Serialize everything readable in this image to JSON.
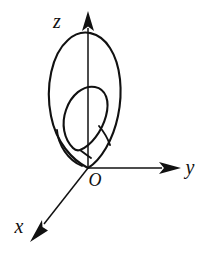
{
  "figure": {
    "background_color": "#ffffff",
    "stroke_color": "#111111",
    "width": 212,
    "height": 253
  },
  "axes": {
    "origin_label": "O",
    "items": [
      {
        "name": "z",
        "label": "z",
        "direction": "up",
        "label_position": {
          "x": 57,
          "y": 28
        },
        "arrow": "solid-triangle"
      },
      {
        "name": "y",
        "label": "y",
        "direction": "right",
        "label_position": {
          "x": 190,
          "y": 163
        },
        "arrow": "solid-triangle"
      },
      {
        "name": "x",
        "label": "x",
        "direction": "down-left",
        "label_position": {
          "x": 19,
          "y": 233
        },
        "arrow": "solid-triangle"
      }
    ]
  },
  "curves": [
    {
      "name": "outer-ellipse",
      "description": "Large tilted ellipse passing through the origin, leaning up and to the right",
      "stroke_width": 2.1
    },
    {
      "name": "inner-ellipse",
      "description": "Smaller tilted ellipse nested inside the lower portion of the outer ellipse",
      "stroke_width": 2.1
    }
  ],
  "origin": {
    "label": "O",
    "position": {
      "x": 88,
      "y": 168
    },
    "label_position": {
      "x": 95,
      "y": 182
    }
  }
}
